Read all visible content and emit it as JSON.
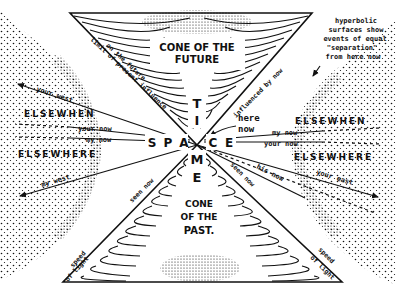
{
  "diagram": {
    "apex": {
      "x": 197,
      "y": 145
    },
    "future_cone": {
      "label_line1": "CONE OF THE",
      "label_line2": "FUTURE",
      "top_y": 13,
      "left_x": 70,
      "right_x": 312
    },
    "past_cone": {
      "label_line1": "CONE",
      "label_line2": "OF THE",
      "label_line3": "PAST.",
      "bottom_y": 282,
      "left_x": 63,
      "right_x": 342
    },
    "axis_time": {
      "letters": [
        "T",
        "I",
        "M",
        "E"
      ]
    },
    "axis_space": {
      "left_letters": [
        "S",
        "P",
        "A"
      ],
      "right_letters": [
        "C",
        "E"
      ]
    },
    "left_region": {
      "elsewhen": "ELSEWHEN",
      "elsewhere": "ELSEWHERE",
      "your_now": "your now",
      "my_now": "my now",
      "your_west": "your west",
      "my_west": "my west"
    },
    "right_region": {
      "elsewhen": "ELSEWHEN",
      "elsewhere": "ELSEWHERE",
      "my_now": "my now",
      "your_now": "your now",
      "your_east": "your east",
      "his_now": "his now"
    },
    "annotations": {
      "limit_line1": "limit of present influence",
      "limit_line2": "on the future",
      "influenced": "influenced by now",
      "here": "here",
      "now": "now",
      "seen_now_left": "seen now",
      "seen_now_right": "seen now",
      "speed_left_1": "speed",
      "speed_left_2": "of light",
      "speed_right_1": "speed",
      "speed_right_2": "of light",
      "hyperbolic": [
        "hyperbolic",
        "surfaces show",
        "events of equal",
        "\"separation\"",
        "from here now"
      ]
    },
    "colors": {
      "ink": "#111111",
      "paper": "#ffffff"
    }
  }
}
